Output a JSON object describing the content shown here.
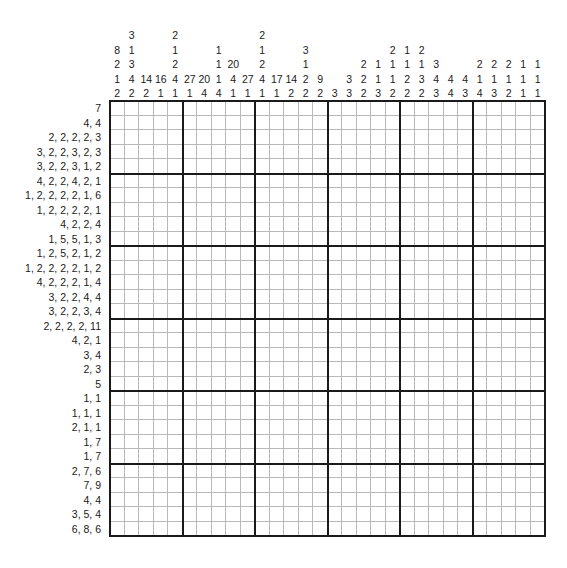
{
  "puzzle": {
    "type": "nonogram",
    "title": "Nonogram",
    "grid_width": 30,
    "grid_height": 30,
    "block_size": 5,
    "cell_px": 14.5,
    "colors": {
      "ink": "#1a1a1a",
      "grid_line": "#b9b9b9",
      "background": "#ffffff"
    },
    "column_clues": [
      [
        8,
        2,
        1,
        2
      ],
      [
        3,
        1,
        3,
        4,
        2
      ],
      [
        14,
        2
      ],
      [
        16,
        1
      ],
      [
        2,
        1,
        2,
        4,
        1
      ],
      [
        27,
        1
      ],
      [
        20,
        4
      ],
      [
        1,
        1,
        1,
        4
      ],
      [
        20,
        4,
        1
      ],
      [
        27,
        1
      ],
      [
        2,
        1,
        2,
        4,
        1
      ],
      [
        17,
        1
      ],
      [
        14,
        2
      ],
      [
        3,
        1,
        2,
        2
      ],
      [
        9,
        2
      ],
      [
        3
      ],
      [
        3,
        3
      ],
      [
        2,
        2,
        2
      ],
      [
        1,
        1,
        3
      ],
      [
        2,
        1,
        1,
        2
      ],
      [
        1,
        1,
        2,
        2
      ],
      [
        2,
        1,
        3,
        2
      ],
      [
        3,
        4,
        3
      ],
      [
        4,
        4
      ],
      [
        4,
        3
      ],
      [
        2,
        1,
        4
      ],
      [
        2,
        1,
        3
      ],
      [
        2,
        1,
        2
      ],
      [
        1,
        1,
        1
      ],
      [
        1,
        1,
        1
      ]
    ],
    "column_clue_strings": [
      "8 2 1 2",
      "3 1 3 4 2",
      "14 2",
      "16 1",
      "2 1 2 4 1",
      "27 1",
      "20 4",
      "1 1 1 4",
      "20 4 1",
      "27 1",
      "2 1 2 4 1",
      "17 1",
      "14 2",
      "3 1 2 2",
      "9 2",
      "3",
      "3 3",
      "2 2 2",
      "1 1 3",
      "2 1 1 2",
      "1 1 2 2",
      "2 1 3 2",
      "3 4 3",
      "4 4",
      "4 3",
      "2 1 4",
      "2 1 3",
      "2 1 2",
      "1 1 1",
      "1 1 1"
    ],
    "row_clues": [
      [
        7
      ],
      [
        4,
        4
      ],
      [
        2,
        2,
        2,
        2,
        3
      ],
      [
        3,
        2,
        2,
        3,
        2,
        3
      ],
      [
        3,
        2,
        2,
        3,
        1,
        2
      ],
      [
        4,
        2,
        2,
        4,
        2,
        1
      ],
      [
        1,
        2,
        2,
        2,
        2,
        1,
        6
      ],
      [
        1,
        2,
        2,
        2,
        2,
        1
      ],
      [
        4,
        2,
        2,
        4
      ],
      [
        1,
        5,
        5,
        1,
        3
      ],
      [
        1,
        2,
        5,
        2,
        1,
        2
      ],
      [
        1,
        2,
        2,
        2,
        2,
        1,
        2
      ],
      [
        4,
        2,
        2,
        2,
        1,
        4
      ],
      [
        3,
        2,
        2,
        4,
        4
      ],
      [
        3,
        2,
        2,
        3,
        4
      ],
      [
        2,
        2,
        2,
        2,
        11
      ],
      [
        4,
        2,
        1
      ],
      [
        3,
        4
      ],
      [
        2,
        3
      ],
      [
        5
      ],
      [
        1,
        1
      ],
      [
        1,
        1,
        1
      ],
      [
        2,
        1,
        1
      ],
      [
        1,
        7
      ],
      [
        1,
        7
      ],
      [
        2,
        7,
        6
      ],
      [
        7,
        9
      ],
      [
        4,
        4
      ],
      [
        3,
        5,
        4
      ],
      [
        6,
        8,
        6
      ]
    ],
    "row_clue_strings": [
      "7",
      "4, 4",
      "2, 2, 2, 2, 3",
      "3, 2, 2, 3, 2, 3",
      "3, 2, 2, 3, 1, 2",
      "4, 2, 2, 4, 2, 1",
      "1, 2, 2, 2, 2, 1, 6",
      "1, 2, 2, 2, 2, 1",
      "4, 2, 2, 4",
      "1, 5, 5, 1, 3",
      "1, 2, 5, 2, 1, 2",
      "1, 2, 2, 2, 2, 1, 2",
      "4, 2, 2, 2, 1, 4",
      "3, 2, 2, 4, 4",
      "3, 2, 2, 3, 4",
      "2, 2, 2, 2, 11",
      "4, 2, 1",
      "3, 4",
      "2, 3",
      "5",
      "1, 1",
      "1, 1, 1",
      "2, 1, 1",
      "1, 7",
      "1, 7",
      "2, 7, 6",
      "7, 9",
      "4, 4",
      "3, 5, 4",
      "6, 8, 6"
    ]
  }
}
